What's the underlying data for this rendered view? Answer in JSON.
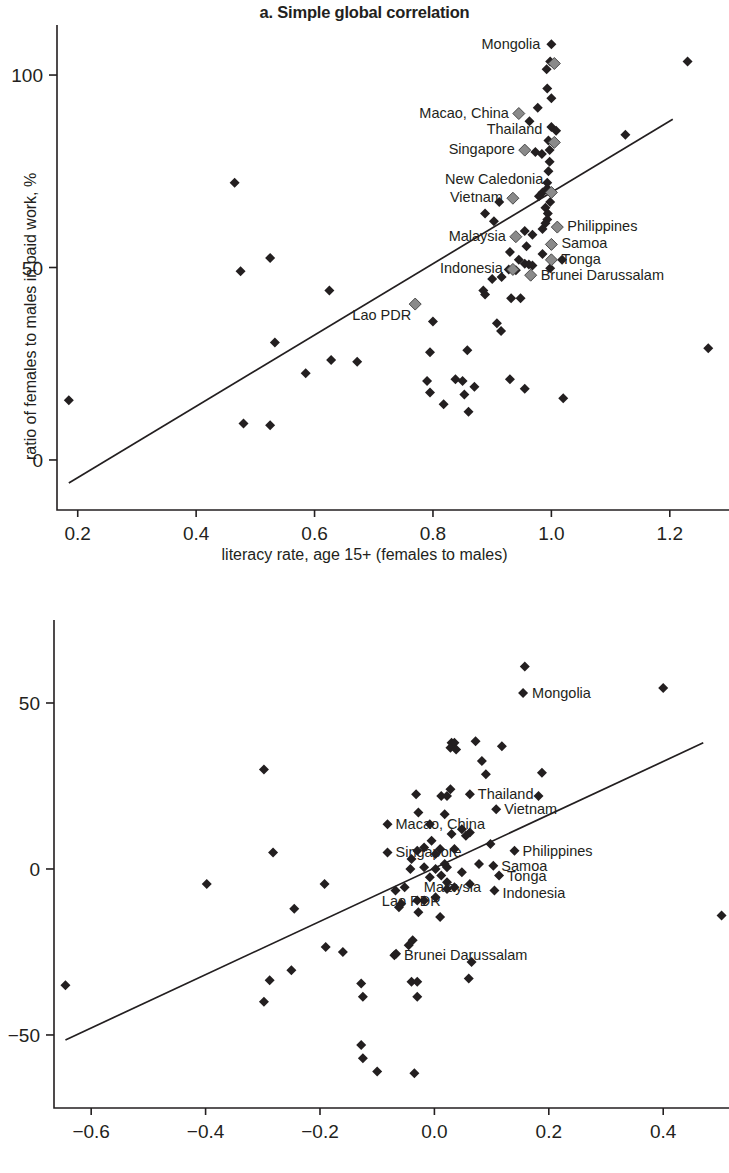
{
  "figure": {
    "axis_title_x": "literacy rate, age 15+ (females to males)",
    "axis_title_y": "ratio of females to males in paid work, %"
  },
  "panel_a": {
    "title_prefix": "a.",
    "title": "Simple global correlation"
  },
  "panel_b": {
    "title_prefix": "b.",
    "title": "Controlling for GDP per capita",
    "title_superscript": "a"
  },
  "chart_data": [
    {
      "type": "scatter",
      "panel": "a",
      "title": "a. Simple global correlation",
      "xlabel": "literacy rate, age 15+ (females to males)",
      "ylabel": "ratio of females to males in paid work, %",
      "xlim": [
        0.165,
        1.3
      ],
      "ylim": [
        -13,
        113
      ],
      "xticks": [
        0.2,
        0.4,
        0.6,
        0.8,
        1.0,
        1.2
      ],
      "xticklabels": [
        "0.2",
        "0.4",
        "0.6",
        "0.8",
        "1.0",
        "1.2"
      ],
      "yticks": [
        0,
        50,
        100
      ],
      "yticklabels": [
        "0",
        "50",
        "100"
      ],
      "grid": false,
      "legend": "none",
      "trendline": {
        "x0": 0.185,
        "y0": -6.0,
        "x1": 1.205,
        "y1": 88.5
      },
      "highlighted_points": [
        {
          "label": "Mongolia",
          "x": 1.005,
          "y": 103.0,
          "label_dx": -14,
          "label_dy": -14,
          "anchor": "end"
        },
        {
          "label": "Macao, China",
          "x": 0.945,
          "y": 90.0,
          "label_dx": -10,
          "label_dy": 4,
          "anchor": "end"
        },
        {
          "label": "Thailand",
          "x": 1.005,
          "y": 82.5,
          "label_dx": -12,
          "label_dy": -8,
          "anchor": "end"
        },
        {
          "label": "Singapore",
          "x": 0.955,
          "y": 80.5,
          "label_dx": -10,
          "label_dy": 4,
          "anchor": "end"
        },
        {
          "label": "New Caledonia",
          "x": 1.0,
          "y": 69.5,
          "label_dx": -8,
          "label_dy": -8,
          "anchor": "end"
        },
        {
          "label": "Vietnam",
          "x": 0.935,
          "y": 68.0,
          "label_dx": -10,
          "label_dy": 4,
          "anchor": "end"
        },
        {
          "label": "Philippines",
          "x": 1.01,
          "y": 60.5,
          "label_dx": 10,
          "label_dy": 4,
          "anchor": "start"
        },
        {
          "label": "Malaysia",
          "x": 0.94,
          "y": 58.0,
          "label_dx": -10,
          "label_dy": 4,
          "anchor": "end"
        },
        {
          "label": "Samoa",
          "x": 1.0,
          "y": 56.0,
          "label_dx": 10,
          "label_dy": 4,
          "anchor": "start"
        },
        {
          "label": "Tonga",
          "x": 1.0,
          "y": 52.0,
          "label_dx": 10,
          "label_dy": 4,
          "anchor": "start"
        },
        {
          "label": "Indonesia",
          "x": 0.935,
          "y": 49.5,
          "label_dx": -10,
          "label_dy": 4,
          "anchor": "end"
        },
        {
          "label": "Brunei Darussalam",
          "x": 0.965,
          "y": 48.0,
          "label_dx": 10,
          "label_dy": 5,
          "anchor": "start"
        },
        {
          "label": "Lao PDR",
          "x": 0.77,
          "y": 40.5,
          "label_dx": -4,
          "label_dy": 16,
          "anchor": "end"
        }
      ],
      "points": [
        {
          "x": 0.185,
          "y": 15.5
        },
        {
          "x": 0.465,
          "y": 72.0
        },
        {
          "x": 0.475,
          "y": 49.0
        },
        {
          "x": 0.525,
          "y": 52.5
        },
        {
          "x": 0.48,
          "y": 9.5
        },
        {
          "x": 0.525,
          "y": 9.0
        },
        {
          "x": 0.533,
          "y": 30.5
        },
        {
          "x": 0.585,
          "y": 22.5
        },
        {
          "x": 0.625,
          "y": 44.0
        },
        {
          "x": 0.628,
          "y": 26.0
        },
        {
          "x": 0.672,
          "y": 25.5
        },
        {
          "x": 0.8,
          "y": 36.0
        },
        {
          "x": 0.795,
          "y": 28.0
        },
        {
          "x": 0.858,
          "y": 28.5
        },
        {
          "x": 0.79,
          "y": 20.5
        },
        {
          "x": 0.838,
          "y": 21.0
        },
        {
          "x": 0.85,
          "y": 20.5
        },
        {
          "x": 0.795,
          "y": 17.5
        },
        {
          "x": 0.818,
          "y": 14.5
        },
        {
          "x": 0.853,
          "y": 17.0
        },
        {
          "x": 0.87,
          "y": 19.0
        },
        {
          "x": 0.86,
          "y": 12.5
        },
        {
          "x": 0.93,
          "y": 21.0
        },
        {
          "x": 0.955,
          "y": 18.5
        },
        {
          "x": 1.02,
          "y": 16.0
        },
        {
          "x": 1.265,
          "y": 29.0
        },
        {
          "x": 1.23,
          "y": 103.5
        },
        {
          "x": 1.125,
          "y": 84.5
        },
        {
          "x": 1.0,
          "y": 108.0
        },
        {
          "x": 0.998,
          "y": 103.5
        },
        {
          "x": 0.992,
          "y": 101.5
        },
        {
          "x": 0.993,
          "y": 96.5
        },
        {
          "x": 1.0,
          "y": 94.0
        },
        {
          "x": 0.977,
          "y": 91.5
        },
        {
          "x": 0.963,
          "y": 88.0
        },
        {
          "x": 1.0,
          "y": 86.5
        },
        {
          "x": 1.008,
          "y": 85.5
        },
        {
          "x": 0.995,
          "y": 83.0
        },
        {
          "x": 0.997,
          "y": 80.5
        },
        {
          "x": 0.973,
          "y": 80.0
        },
        {
          "x": 0.984,
          "y": 79.5
        },
        {
          "x": 0.997,
          "y": 77.5
        },
        {
          "x": 0.995,
          "y": 75.0
        },
        {
          "x": 0.993,
          "y": 72.0
        },
        {
          "x": 0.993,
          "y": 70.5
        },
        {
          "x": 0.985,
          "y": 69.5
        },
        {
          "x": 0.979,
          "y": 68.5
        },
        {
          "x": 0.998,
          "y": 67.0
        },
        {
          "x": 0.99,
          "y": 65.5
        },
        {
          "x": 0.994,
          "y": 64.0
        },
        {
          "x": 0.993,
          "y": 62.5
        },
        {
          "x": 0.99,
          "y": 61.5
        },
        {
          "x": 0.985,
          "y": 60.0
        },
        {
          "x": 0.912,
          "y": 67.0
        },
        {
          "x": 0.888,
          "y": 64.0
        },
        {
          "x": 0.903,
          "y": 62.0
        },
        {
          "x": 0.955,
          "y": 59.5
        },
        {
          "x": 0.968,
          "y": 58.5
        },
        {
          "x": 0.958,
          "y": 55.5
        },
        {
          "x": 0.93,
          "y": 54.0
        },
        {
          "x": 0.945,
          "y": 52.0
        },
        {
          "x": 0.985,
          "y": 53.5
        },
        {
          "x": 1.018,
          "y": 52.0
        },
        {
          "x": 0.955,
          "y": 51.0
        },
        {
          "x": 0.962,
          "y": 50.8
        },
        {
          "x": 0.968,
          "y": 50.5
        },
        {
          "x": 0.928,
          "y": 49.5
        },
        {
          "x": 0.94,
          "y": 49.3
        },
        {
          "x": 0.9,
          "y": 47.0
        },
        {
          "x": 0.916,
          "y": 47.5
        },
        {
          "x": 0.998,
          "y": 49.8
        },
        {
          "x": 0.885,
          "y": 44.0
        },
        {
          "x": 0.888,
          "y": 43.0
        },
        {
          "x": 0.932,
          "y": 42.0
        },
        {
          "x": 0.948,
          "y": 42.0
        },
        {
          "x": 0.908,
          "y": 35.5
        },
        {
          "x": 0.915,
          "y": 33.5
        }
      ]
    },
    {
      "type": "scatter",
      "panel": "b",
      "title": "b. Controlling for GDP per capita",
      "xlabel": "literacy rate, age 15+ (females to males)",
      "ylabel": "ratio of females to males in paid work, %",
      "xlim": [
        -0.665,
        0.515
      ],
      "ylim": [
        -72,
        75
      ],
      "xticks": [
        -0.6,
        -0.4,
        -0.2,
        0.0,
        0.2,
        0.4
      ],
      "xticklabels": [
        "−0.6",
        "−0.4",
        "−0.2",
        "0.0",
        "0.2",
        "0.4"
      ],
      "yticks": [
        -50,
        0,
        50
      ],
      "yticklabels": [
        "−50",
        "0",
        "50"
      ],
      "grid": false,
      "legend": "none",
      "trendline": {
        "x0": -0.645,
        "y0": -51.5,
        "x1": 0.47,
        "y1": 38.0
      },
      "highlighted_points": [
        {
          "label": "Mongolia",
          "x": 0.155,
          "y": 53.0,
          "label_dx": 9,
          "label_dy": 5,
          "anchor": "start"
        },
        {
          "label": "Thailand",
          "x": 0.062,
          "y": 22.5,
          "label_dx": 8,
          "label_dy": 5,
          "anchor": "start"
        },
        {
          "label": "Vietnam",
          "x": 0.108,
          "y": 18.0,
          "label_dx": 8,
          "label_dy": 5,
          "anchor": "start"
        },
        {
          "label": "Macao, China",
          "x": -0.082,
          "y": 13.5,
          "label_dx": 8,
          "label_dy": 5,
          "anchor": "start"
        },
        {
          "label": "Philippines",
          "x": 0.14,
          "y": 5.5,
          "label_dx": 8,
          "label_dy": 5,
          "anchor": "start"
        },
        {
          "label": "Singapore",
          "x": -0.082,
          "y": 5.0,
          "label_dx": 8,
          "label_dy": 5,
          "anchor": "start"
        },
        {
          "label": "Samoa",
          "x": 0.103,
          "y": 1.0,
          "label_dx": 8,
          "label_dy": 5,
          "anchor": "start"
        },
        {
          "label": "Tonga",
          "x": 0.113,
          "y": -2.0,
          "label_dx": 8,
          "label_dy": 5,
          "anchor": "start"
        },
        {
          "label": "Malaysia",
          "x": 0.035,
          "y": -5.5,
          "label_dx": -2,
          "label_dy": 5,
          "anchor": "middle"
        },
        {
          "label": "Indonesia",
          "x": 0.105,
          "y": -6.5,
          "label_dx": 8,
          "label_dy": 7,
          "anchor": "start"
        },
        {
          "label": "Lao PDR",
          "x": -0.03,
          "y": -9.5,
          "label_dx": -6,
          "label_dy": 5,
          "anchor": "middle"
        },
        {
          "label": "Brunei Darussalam",
          "x": -0.067,
          "y": -25.5,
          "label_dx": 8,
          "label_dy": 6,
          "anchor": "start"
        }
      ],
      "points": [
        {
          "x": -0.645,
          "y": -35.0
        },
        {
          "x": -0.398,
          "y": -4.5
        },
        {
          "x": -0.298,
          "y": 30.0
        },
        {
          "x": -0.282,
          "y": 5.0
        },
        {
          "x": -0.245,
          "y": -12.0
        },
        {
          "x": -0.192,
          "y": -4.5
        },
        {
          "x": -0.19,
          "y": -23.5
        },
        {
          "x": -0.16,
          "y": -25.0
        },
        {
          "x": -0.25,
          "y": -30.5
        },
        {
          "x": -0.288,
          "y": -33.5
        },
        {
          "x": -0.298,
          "y": -40.0
        },
        {
          "x": -0.128,
          "y": -34.5
        },
        {
          "x": -0.125,
          "y": -38.5
        },
        {
          "x": -0.128,
          "y": -53.0
        },
        {
          "x": -0.125,
          "y": -57.0
        },
        {
          "x": -0.1,
          "y": -61.0
        },
        {
          "x": -0.035,
          "y": -61.5
        },
        {
          "x": -0.04,
          "y": -34.0
        },
        {
          "x": -0.03,
          "y": -34.0
        },
        {
          "x": -0.03,
          "y": -38.5
        },
        {
          "x": 0.065,
          "y": -28.0
        },
        {
          "x": 0.06,
          "y": -33.0
        },
        {
          "x": -0.045,
          "y": -23.0
        },
        {
          "x": 0.502,
          "y": -14.0
        },
        {
          "x": 0.4,
          "y": 54.5
        },
        {
          "x": 0.158,
          "y": 61.0
        },
        {
          "x": 0.03,
          "y": 38.0
        },
        {
          "x": 0.035,
          "y": 38.0
        },
        {
          "x": 0.028,
          "y": 36.5
        },
        {
          "x": 0.038,
          "y": 36.0
        },
        {
          "x": 0.072,
          "y": 38.5
        },
        {
          "x": 0.118,
          "y": 37.0
        },
        {
          "x": 0.083,
          "y": 32.5
        },
        {
          "x": 0.09,
          "y": 28.5
        },
        {
          "x": 0.188,
          "y": 29.0
        },
        {
          "x": 0.028,
          "y": 24.0
        },
        {
          "x": -0.032,
          "y": 22.5
        },
        {
          "x": -0.028,
          "y": 17.0
        },
        {
          "x": 0.012,
          "y": 22.0
        },
        {
          "x": 0.022,
          "y": 22.0
        },
        {
          "x": 0.182,
          "y": 22.0
        },
        {
          "x": 0.018,
          "y": 16.5
        },
        {
          "x": -0.008,
          "y": 13.5
        },
        {
          "x": 0.048,
          "y": 12.0
        },
        {
          "x": 0.062,
          "y": 11.0
        },
        {
          "x": 0.055,
          "y": 10.0
        },
        {
          "x": 0.03,
          "y": 10.5
        },
        {
          "x": -0.005,
          "y": 8.5
        },
        {
          "x": -0.018,
          "y": 6.5
        },
        {
          "x": 0.01,
          "y": 6.0
        },
        {
          "x": 0.035,
          "y": 6.0
        },
        {
          "x": -0.04,
          "y": 3.0
        },
        {
          "x": -0.03,
          "y": 5.5
        },
        {
          "x": 0.002,
          "y": 4.5
        },
        {
          "x": 0.098,
          "y": 7.5
        },
        {
          "x": -0.042,
          "y": 0.0
        },
        {
          "x": -0.018,
          "y": 0.5
        },
        {
          "x": 0.002,
          "y": 0.0
        },
        {
          "x": 0.022,
          "y": 0.5
        },
        {
          "x": 0.018,
          "y": 1.5
        },
        {
          "x": 0.078,
          "y": 1.5
        },
        {
          "x": 0.048,
          "y": -1.0
        },
        {
          "x": -0.008,
          "y": -2.5
        },
        {
          "x": 0.012,
          "y": -2.0
        },
        {
          "x": 0.022,
          "y": -4.0
        },
        {
          "x": 0.062,
          "y": -4.5
        },
        {
          "x": -0.068,
          "y": -6.5
        },
        {
          "x": -0.052,
          "y": -5.5
        },
        {
          "x": 0.022,
          "y": -6.0
        },
        {
          "x": -0.058,
          "y": -10.5
        },
        {
          "x": -0.018,
          "y": -9.5
        },
        {
          "x": 0.002,
          "y": -8.5
        },
        {
          "x": -0.062,
          "y": -11.5
        },
        {
          "x": -0.028,
          "y": -13.0
        },
        {
          "x": 0.01,
          "y": -14.5
        },
        {
          "x": -0.038,
          "y": -21.5
        },
        {
          "x": -0.07,
          "y": -26.0
        }
      ]
    }
  ]
}
